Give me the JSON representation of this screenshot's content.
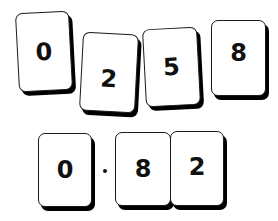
{
  "top_row": {
    "cards": [
      {
        "label": "0",
        "rotation_deg": -3
      },
      {
        "label": "2",
        "rotation_deg": 3
      },
      {
        "label": "5",
        "rotation_deg": -3
      },
      {
        "label": "8",
        "rotation_deg": 0
      }
    ]
  },
  "bottom_row": {
    "cards": [
      {
        "label": "0"
      },
      {
        "label": "8"
      },
      {
        "label": "2"
      }
    ],
    "decimal_point": "·",
    "number": "0.82"
  },
  "colors": {
    "card_fill": "#ffffff",
    "card_border": "#1a1a1a",
    "card_shadow": "#000000",
    "text": "#111111",
    "background": "#ffffff"
  }
}
